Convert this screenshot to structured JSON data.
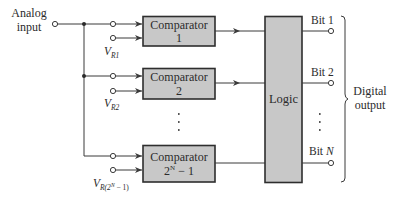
{
  "diagram": {
    "input": {
      "label_line1": "Analog",
      "label_line2": "input"
    },
    "comparators": [
      {
        "label_line1": "Comparator",
        "label_line2": "1",
        "ref_main": "V",
        "ref_sub": "R1",
        "ref_sup": ""
      },
      {
        "label_line1": "Comparator",
        "label_line2": "2",
        "ref_main": "V",
        "ref_sub": "R2",
        "ref_sup": ""
      },
      {
        "label_line1": "Comparator",
        "label_line2_base": "2",
        "label_line2_sup": "N",
        "label_line2_rest": " − 1",
        "ref_main": "V",
        "ref_sub": "R(2",
        "ref_sup": "N",
        "ref_sub_end": " − 1)"
      }
    ],
    "ellipsis": "⋮",
    "logic": {
      "label": "Logic"
    },
    "outputs": [
      {
        "label": "Bit 1"
      },
      {
        "label": "Bit 2"
      },
      {
        "label_base": "Bit ",
        "label_var": "N"
      }
    ],
    "output_group": {
      "label_line1": "Digital",
      "label_line2": "output"
    },
    "colors": {
      "box_fill": "#c8c8c8",
      "stroke": "#2e2e2e",
      "text": "#2b2b2b",
      "background": "#ffffff"
    }
  }
}
